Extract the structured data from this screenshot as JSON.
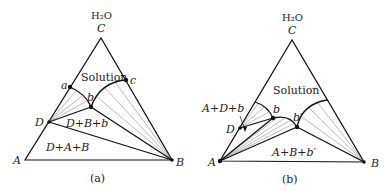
{
  "figure_a": {
    "caption": "(a)",
    "top_label": "H₂O",
    "vertices": {
      "A": "A",
      "B": "B",
      "C": "C"
    },
    "points": {
      "D": "D",
      "a": "a",
      "b": "b",
      "c": "c"
    },
    "regions": {
      "solution": "Solution",
      "dbb": "D+B+b",
      "dab": "D+A+B"
    }
  },
  "figure_b": {
    "caption": "(b)",
    "top_label": "H₂O",
    "vertices": {
      "A": "A",
      "B": "B",
      "C": "C"
    },
    "points": {
      "D": "D",
      "b": "b",
      "bprime": "b′"
    },
    "regions": {
      "solution": "Solution",
      "adb": "A+D+b",
      "abb": "A+B+b′"
    }
  }
}
